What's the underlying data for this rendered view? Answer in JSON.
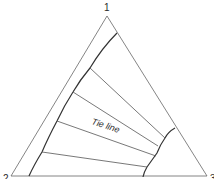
{
  "diagram": {
    "type": "ternary-phase-diagram",
    "vertices": {
      "top": "1",
      "bottom_left": "2",
      "bottom_right": "3"
    },
    "annotation": "Tie line",
    "colors": {
      "line": "#555555",
      "curve": "#333333",
      "text": "#2a2a2a"
    }
  }
}
